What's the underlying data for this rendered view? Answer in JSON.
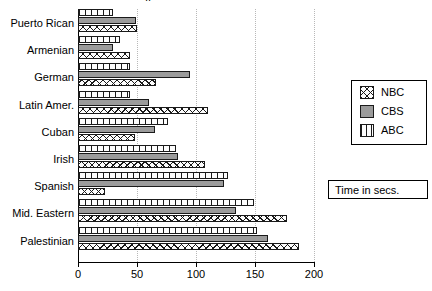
{
  "title_fragment": "..",
  "note": {
    "text": "Time in secs."
  },
  "legend": {
    "items": [
      {
        "key": "nbc",
        "label": "NBC",
        "swatch": "crosshatch-swatch"
      },
      {
        "key": "cbs",
        "label": "CBS",
        "swatch": "solid-gray-swatch"
      },
      {
        "key": "abc",
        "label": "ABC",
        "swatch": "vertical-lines-swatch"
      }
    ]
  },
  "axis": {
    "ticks": [
      "0",
      "50",
      "100",
      "150",
      "200"
    ],
    "tick_values": [
      0,
      50,
      100,
      150,
      200
    ]
  },
  "chart_data": {
    "type": "bar",
    "orientation": "horizontal",
    "title": "",
    "xlabel": "Time in secs.",
    "ylabel": "",
    "xlim": [
      0,
      200
    ],
    "grid": true,
    "legend_position": "right",
    "categories": [
      "Puerto Rican",
      "Armenian",
      "German",
      "Latin Amer.",
      "Cuban",
      "Irish",
      "Spanish",
      "Mid. Eastern",
      "Palestinian"
    ],
    "series": [
      {
        "name": "ABC",
        "values": [
          30,
          36,
          44,
          44,
          76,
          83,
          127,
          149,
          152
        ]
      },
      {
        "name": "CBS",
        "values": [
          49,
          30,
          95,
          60,
          65,
          85,
          124,
          134,
          161
        ]
      },
      {
        "name": "NBC",
        "values": [
          50,
          44,
          66,
          110,
          48,
          108,
          23,
          177,
          187
        ]
      }
    ]
  }
}
